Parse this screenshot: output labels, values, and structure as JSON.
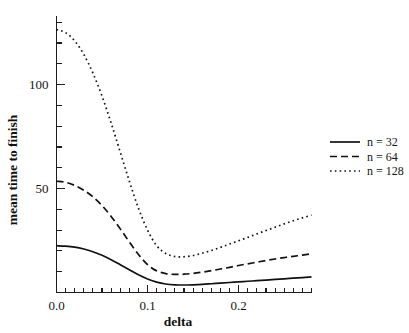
{
  "chart_data": {
    "type": "line",
    "title": "",
    "xlabel": "delta",
    "ylabel": "mean time to finish",
    "xlim": [
      0.0,
      0.28
    ],
    "ylim": [
      0,
      133
    ],
    "grid": false,
    "legend_position": "right",
    "x_ticks_labeled": [
      "0.0",
      "0.1",
      "0.2"
    ],
    "x_tick_values": [
      0.0,
      0.1,
      0.2
    ],
    "x_minor_step": 0.01,
    "y_ticks_labeled": [
      "50",
      "100"
    ],
    "y_tick_values": [
      50,
      100
    ],
    "y_minor_step": 10,
    "series": [
      {
        "name": "n = 32",
        "style": "solid",
        "x": [
          0.0,
          0.01,
          0.02,
          0.03,
          0.04,
          0.05,
          0.06,
          0.07,
          0.08,
          0.09,
          0.1,
          0.11,
          0.12,
          0.13,
          0.14,
          0.15,
          0.16,
          0.17,
          0.18,
          0.19,
          0.2,
          0.21,
          0.22,
          0.23,
          0.24,
          0.25,
          0.26,
          0.27,
          0.28
        ],
        "values": [
          22.5,
          22.3,
          21.8,
          20.9,
          19.6,
          17.9,
          15.8,
          13.4,
          10.9,
          8.5,
          6.5,
          5.0,
          4.1,
          3.7,
          3.6,
          3.7,
          3.9,
          4.2,
          4.5,
          4.8,
          5.1,
          5.4,
          5.7,
          6.0,
          6.3,
          6.6,
          6.9,
          7.2,
          7.5
        ]
      },
      {
        "name": "n = 64",
        "style": "dashed",
        "x": [
          0.0,
          0.01,
          0.02,
          0.03,
          0.04,
          0.05,
          0.06,
          0.07,
          0.08,
          0.09,
          0.1,
          0.11,
          0.12,
          0.13,
          0.14,
          0.15,
          0.16,
          0.17,
          0.18,
          0.19,
          0.2,
          0.21,
          0.22,
          0.23,
          0.24,
          0.25,
          0.26,
          0.27,
          0.28
        ],
        "values": [
          53.5,
          53.0,
          51.5,
          49.2,
          46.0,
          41.8,
          36.6,
          30.6,
          24.3,
          18.3,
          13.4,
          10.4,
          9.1,
          8.7,
          8.8,
          9.2,
          9.8,
          10.5,
          11.3,
          12.1,
          13.0,
          13.8,
          14.6,
          15.4,
          16.1,
          16.8,
          17.4,
          18.0,
          18.6
        ]
      },
      {
        "name": "n = 128",
        "style": "dotted",
        "x": [
          0.0,
          0.01,
          0.02,
          0.03,
          0.04,
          0.05,
          0.06,
          0.07,
          0.08,
          0.09,
          0.1,
          0.11,
          0.12,
          0.13,
          0.14,
          0.15,
          0.16,
          0.17,
          0.18,
          0.19,
          0.2,
          0.21,
          0.22,
          0.23,
          0.24,
          0.25,
          0.26,
          0.27,
          0.28
        ],
        "values": [
          126.5,
          125.0,
          121.0,
          114.5,
          105.5,
          94.5,
          81.5,
          67.5,
          53.5,
          40.5,
          30.0,
          22.5,
          18.8,
          17.3,
          17.2,
          17.8,
          18.9,
          20.2,
          21.7,
          23.3,
          24.9,
          26.5,
          28.2,
          29.8,
          31.4,
          33.0,
          34.5,
          35.9,
          37.2
        ]
      }
    ]
  },
  "legend": {
    "entries": [
      {
        "label": "n = 32",
        "style": "solid"
      },
      {
        "label": "n = 64",
        "style": "dashed"
      },
      {
        "label": "n = 128",
        "style": "dotted"
      }
    ]
  },
  "axes": {
    "x_title": "delta",
    "y_title": "mean time to finish",
    "x_tick_labels": [
      "0.0",
      "0.1",
      "0.2"
    ],
    "y_tick_labels": [
      "100",
      "50"
    ]
  }
}
